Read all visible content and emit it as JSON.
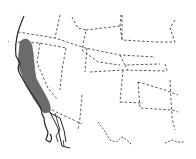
{
  "map": {
    "type": "range-map",
    "region": "Western United States",
    "colors": {
      "background": "#ffffff",
      "range_fill": "#6b6b6b",
      "coastline": "#222222",
      "state_border": "#444444"
    },
    "highlighted_range": {
      "description": "Pacific coastal range (Oregon to southern California)"
    }
  }
}
